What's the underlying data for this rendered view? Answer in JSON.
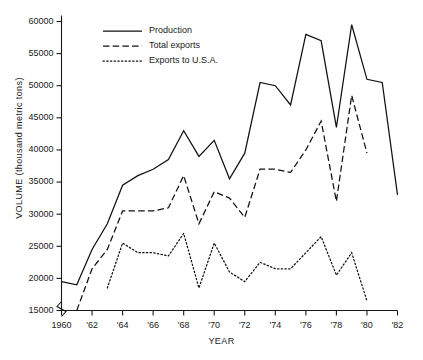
{
  "chart_data": {
    "type": "line",
    "title": "",
    "xlabel": "YEAR",
    "ylabel": "VOLUME (thousand metric tons)",
    "xlim": [
      1960,
      1982
    ],
    "ylim": [
      15000,
      60000
    ],
    "y_ticks": [
      15000,
      20000,
      25000,
      30000,
      35000,
      40000,
      45000,
      50000,
      55000,
      60000
    ],
    "y_tick_labels": [
      "15000",
      "20000",
      "25000",
      "30000",
      "35000",
      "40000",
      "45000",
      "50000",
      "55000",
      "60000"
    ],
    "x_ticks": [
      1960,
      1962,
      1964,
      1966,
      1968,
      1970,
      1972,
      1974,
      1976,
      1978,
      1980,
      1982
    ],
    "x_tick_labels": [
      "1960",
      "'62",
      "'64",
      "'66",
      "'68",
      "'70",
      "'72",
      "'74",
      "'76",
      "'78",
      "'80",
      "'82"
    ],
    "grid": false,
    "axis_break": true,
    "legend_position": "top-center",
    "series": [
      {
        "name": "Production",
        "style": "solid",
        "x": [
          1960,
          1961,
          1962,
          1963,
          1964,
          1965,
          1966,
          1967,
          1968,
          1969,
          1970,
          1971,
          1972,
          1973,
          1974,
          1975,
          1976,
          1977,
          1978,
          1979,
          1980,
          1981,
          1982
        ],
        "values": [
          19500,
          19000,
          24500,
          28500,
          34500,
          36000,
          37000,
          38500,
          43000,
          39000,
          41500,
          35500,
          39500,
          50500,
          50000,
          47000,
          58000,
          57000,
          43500,
          59500,
          51000,
          50500,
          33000
        ]
      },
      {
        "name": "Total exports",
        "style": "dashed",
        "x": [
          1961,
          1962,
          1963,
          1964,
          1965,
          1966,
          1967,
          1968,
          1969,
          1970,
          1971,
          1972,
          1973,
          1974,
          1975,
          1976,
          1977,
          1978,
          1979,
          1980
        ],
        "values": [
          15000,
          21500,
          24500,
          30500,
          30500,
          30500,
          31000,
          36000,
          28500,
          33500,
          32500,
          29500,
          37000,
          37000,
          36500,
          40000,
          44500,
          32000,
          48500,
          39500
        ]
      },
      {
        "name": "Exports to U.S.A.",
        "style": "dotted",
        "x": [
          1963,
          1964,
          1965,
          1966,
          1967,
          1968,
          1969,
          1970,
          1971,
          1972,
          1973,
          1974,
          1975,
          1976,
          1977,
          1978,
          1979,
          1980
        ],
        "values": [
          18500,
          25500,
          24000,
          24000,
          23500,
          27000,
          18500,
          25500,
          21000,
          19500,
          22500,
          21500,
          21500,
          24000,
          26500,
          20500,
          24000,
          16500
        ]
      }
    ]
  },
  "legend": {
    "items": [
      {
        "label": "Production",
        "style": "solid"
      },
      {
        "label": "Total exports",
        "style": "dashed"
      },
      {
        "label": "Exports to U.S.A.",
        "style": "dotted"
      }
    ]
  }
}
